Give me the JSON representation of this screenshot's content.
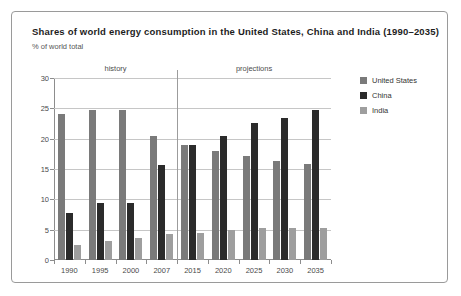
{
  "title": "Shares of world energy consumption in the United States, China and India (1990–2035)",
  "subtitle": "% of world total",
  "annotations": {
    "history": "history",
    "projections": "projections"
  },
  "colors": {
    "united_states": "#7a7a7a",
    "china": "#2b2b2b",
    "india": "#9e9e9e",
    "grid": "#c6c6c6",
    "axis": "#8d8d8d",
    "frame": "#9a9a9a"
  },
  "legend": [
    {
      "label": "United States",
      "color": "#7a7a7a"
    },
    {
      "label": "China",
      "color": "#2b2b2b"
    },
    {
      "label": "India",
      "color": "#9e9e9e"
    }
  ],
  "chart_data": {
    "type": "bar",
    "title": "Shares of world energy consumption in the United States, China and India (1990–2035)",
    "subtitle": "% of world total",
    "xlabel": "",
    "ylabel": "% of world total",
    "ylim": [
      0,
      30
    ],
    "yticks": [
      0,
      5,
      10,
      15,
      20,
      25,
      30
    ],
    "grid": true,
    "legend_position": "right",
    "categories": [
      "1990",
      "1995",
      "2000",
      "2007",
      "2015",
      "2020",
      "2025",
      "2030",
      "2035"
    ],
    "series": [
      {
        "name": "United States",
        "color": "#7a7a7a",
        "values": [
          24.0,
          24.7,
          24.7,
          20.4,
          19.0,
          18.0,
          17.1,
          16.3,
          15.8
        ]
      },
      {
        "name": "China",
        "color": "#2b2b2b",
        "values": [
          7.7,
          9.4,
          9.4,
          15.6,
          18.9,
          20.5,
          22.6,
          23.4,
          24.7
        ]
      },
      {
        "name": "India",
        "color": "#9e9e9e",
        "values": [
          2.5,
          3.1,
          3.6,
          4.3,
          4.4,
          4.9,
          5.2,
          5.2,
          5.2
        ]
      }
    ],
    "annotations": [
      {
        "text": "history",
        "categories": [
          "1990",
          "1995",
          "2000",
          "2007"
        ]
      },
      {
        "text": "projections",
        "categories": [
          "2015",
          "2020",
          "2025",
          "2030",
          "2035"
        ]
      }
    ]
  }
}
